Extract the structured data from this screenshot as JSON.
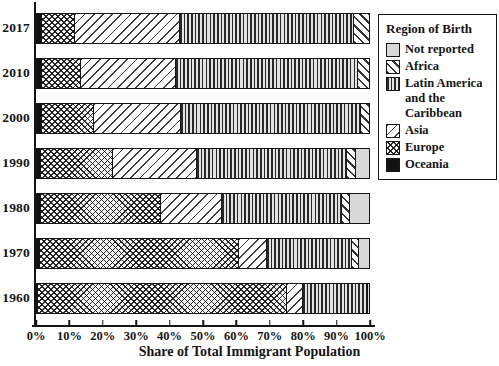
{
  "legend": {
    "title": "Region of Birth",
    "entries": [
      {
        "key": "not_reported",
        "label": "Not reported",
        "pattern": "solid-light-gray",
        "color": "#d8d8d8"
      },
      {
        "key": "africa",
        "label": "Africa",
        "pattern": "diagonal-backslash-hatch"
      },
      {
        "key": "latin_america",
        "label": "Latin America and the Caribbean",
        "pattern": "vertical-line-hatch"
      },
      {
        "key": "asia",
        "label": "Asia",
        "pattern": "diagonal-slash-hatch"
      },
      {
        "key": "europe",
        "label": "Europe",
        "pattern": "cross-hatch"
      },
      {
        "key": "oceania",
        "label": "Oceania",
        "pattern": "solid-black",
        "color": "#121212"
      }
    ]
  },
  "chart_data": {
    "type": "bar",
    "orientation": "horizontal",
    "stacked": true,
    "title": "",
    "xlabel": "Share of Total Immigrant Population",
    "ylabel": "",
    "xlim": [
      0,
      100
    ],
    "x_tick_labels": [
      "0%",
      "10%",
      "20%",
      "30%",
      "40%",
      "50%",
      "60%",
      "70%",
      "80%",
      "90%",
      "100%"
    ],
    "grid": false,
    "legend_position": "upper-right",
    "categories": [
      "2017",
      "2010",
      "2000",
      "1990",
      "1980",
      "1970",
      "1960"
    ],
    "stack_order_left_to_right": [
      "oceania",
      "europe",
      "asia",
      "latin_america",
      "africa",
      "not_reported"
    ],
    "series": [
      {
        "key": "oceania",
        "name": "Oceania",
        "values": [
          1.5,
          1.5,
          1.5,
          1.3,
          1.2,
          0.8,
          0.4
        ]
      },
      {
        "key": "europe",
        "name": "Europe",
        "values": [
          10.0,
          11.8,
          15.8,
          21.6,
          36.3,
          60.1,
          75.0
        ]
      },
      {
        "key": "asia",
        "name": "Asia",
        "values": [
          31.6,
          28.5,
          26.1,
          25.2,
          18.1,
          8.5,
          4.8
        ]
      },
      {
        "key": "latin_america",
        "name": "Latin America and the Caribbean",
        "values": [
          52.4,
          55.0,
          54.2,
          45.4,
          36.3,
          25.6,
          19.1
        ]
      },
      {
        "key": "africa",
        "name": "Africa",
        "values": [
          4.5,
          3.2,
          2.4,
          2.5,
          2.4,
          2.0,
          0.3
        ]
      },
      {
        "key": "not_reported",
        "name": "Not reported",
        "values": [
          0.0,
          0.0,
          0.0,
          4.0,
          5.7,
          3.0,
          0.4
        ]
      }
    ]
  }
}
